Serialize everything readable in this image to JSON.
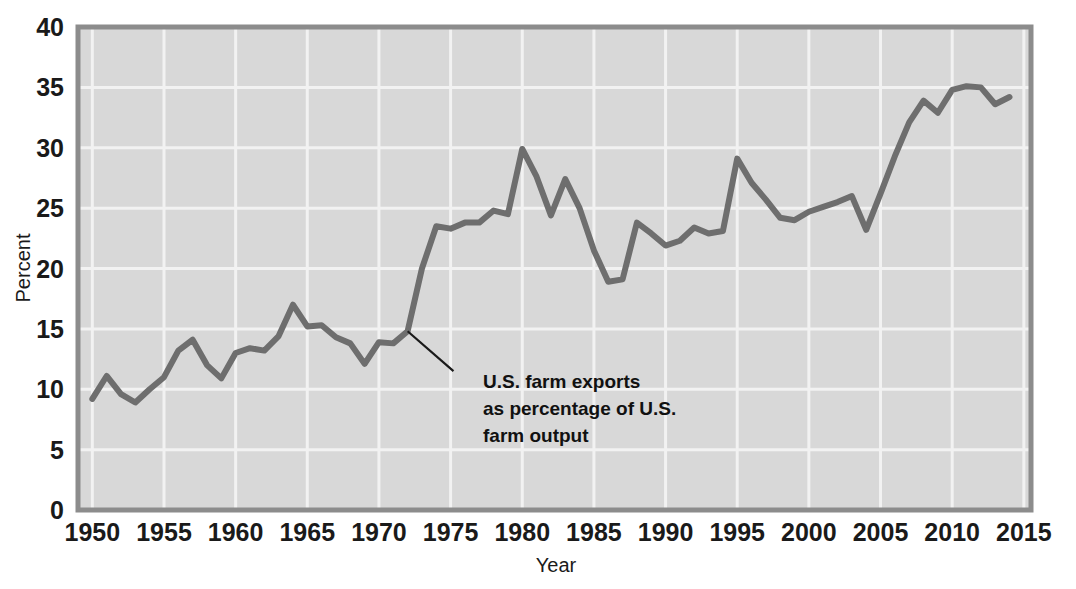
{
  "chart_data": {
    "type": "line",
    "title": "",
    "xlabel": "Year",
    "ylabel": "Percent",
    "xlim": [
      1949,
      2015.5
    ],
    "ylim": [
      0,
      40
    ],
    "grid": true,
    "legend": "none",
    "xticks": [
      "1950",
      "1955",
      "1960",
      "1965",
      "1970",
      "1975",
      "1980",
      "1985",
      "1990",
      "1995",
      "2000",
      "2005",
      "2010",
      "2015"
    ],
    "xtick_values": [
      1950,
      1955,
      1960,
      1965,
      1970,
      1975,
      1980,
      1985,
      1990,
      1995,
      2000,
      2005,
      2010,
      2015
    ],
    "yticks": [
      "0",
      "5",
      "10",
      "15",
      "20",
      "25",
      "30",
      "35",
      "40"
    ],
    "ytick_values": [
      0,
      5,
      10,
      15,
      20,
      25,
      30,
      35,
      40
    ],
    "series": [
      {
        "name": "U.S. farm exports as percentage of U.S. farm output",
        "color": "#6e6e6e",
        "x": [
          1950,
          1951,
          1952,
          1953,
          1954,
          1955,
          1956,
          1957,
          1958,
          1959,
          1960,
          1961,
          1962,
          1963,
          1964,
          1965,
          1966,
          1967,
          1968,
          1969,
          1970,
          1971,
          1972,
          1973,
          1974,
          1975,
          1976,
          1977,
          1978,
          1979,
          1980,
          1981,
          1982,
          1983,
          1984,
          1985,
          1986,
          1987,
          1988,
          1989,
          1990,
          1991,
          1992,
          1993,
          1994,
          1995,
          1996,
          1997,
          1998,
          1999,
          2000,
          2001,
          2002,
          2003,
          2004,
          2005,
          2006,
          2007,
          2008,
          2009,
          2010,
          2011,
          2012,
          2013,
          2014
        ],
        "values": [
          9.2,
          11.1,
          9.6,
          8.9,
          10.0,
          11.0,
          13.2,
          14.1,
          12.0,
          10.9,
          13.0,
          13.4,
          13.2,
          14.4,
          17.0,
          15.2,
          15.3,
          14.3,
          13.8,
          12.1,
          13.9,
          13.8,
          14.8,
          20.0,
          23.5,
          23.3,
          23.8,
          23.8,
          24.8,
          24.5,
          29.9,
          27.6,
          24.4,
          27.4,
          25.0,
          21.5,
          18.9,
          19.1,
          23.8,
          22.9,
          21.9,
          22.3,
          23.4,
          22.9,
          23.1,
          29.1,
          27.1,
          25.7,
          24.2,
          24.0,
          24.7,
          25.1,
          25.5,
          26.0,
          23.2,
          26.2,
          29.3,
          32.1,
          33.9,
          32.9,
          34.8,
          35.1,
          35.0,
          33.6,
          34.2
        ]
      }
    ],
    "annotations": [
      {
        "name": "series-callout",
        "lines": [
          "U.S. farm exports",
          "as percentage of U.S.",
          "farm output"
        ],
        "point_x": 1972.0,
        "point_y": 14.8,
        "text_x": 1975.2,
        "text_y": 11.5
      }
    ]
  },
  "style": {
    "plot_background": "#d8d8d8",
    "grid_color": "#f2f2f2",
    "border_color": "#8c8c8c",
    "line_color": "#6e6e6e",
    "text_color": "#1a1a1a",
    "page_background": "#ffffff"
  }
}
